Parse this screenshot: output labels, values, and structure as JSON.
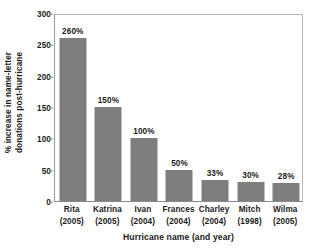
{
  "chart_data": {
    "type": "bar",
    "title": "",
    "xlabel": "Hurricane name (and year)",
    "ylabel_line1": "% increase in name-letter",
    "ylabel_line2": "donations post-hurricane",
    "categories": [
      {
        "name": "Rita",
        "year": "(2005)"
      },
      {
        "name": "Katrina",
        "year": "(2005)"
      },
      {
        "name": "Ivan",
        "year": "(2004)"
      },
      {
        "name": "Frances",
        "year": "(2004)"
      },
      {
        "name": "Charley",
        "year": "(2004)"
      },
      {
        "name": "Mitch",
        "year": "(1998)"
      },
      {
        "name": "Wilma",
        "year": "(2005)"
      }
    ],
    "values": [
      260,
      150,
      100,
      50,
      33,
      30,
      28
    ],
    "value_labels": [
      "260%",
      "150%",
      "100%",
      "50%",
      "33%",
      "30%",
      "28%"
    ],
    "ylim": [
      0,
      300
    ],
    "yticks": [
      0,
      50,
      100,
      150,
      200,
      250,
      300
    ],
    "ytick_labels": [
      "0",
      "50",
      "100",
      "150",
      "200",
      "250",
      "300"
    ],
    "grid": false,
    "legend": "none",
    "bar_color": "#7e7e7e",
    "axis_color": "#8a8a8a",
    "text_color": "#1b1b1b"
  }
}
